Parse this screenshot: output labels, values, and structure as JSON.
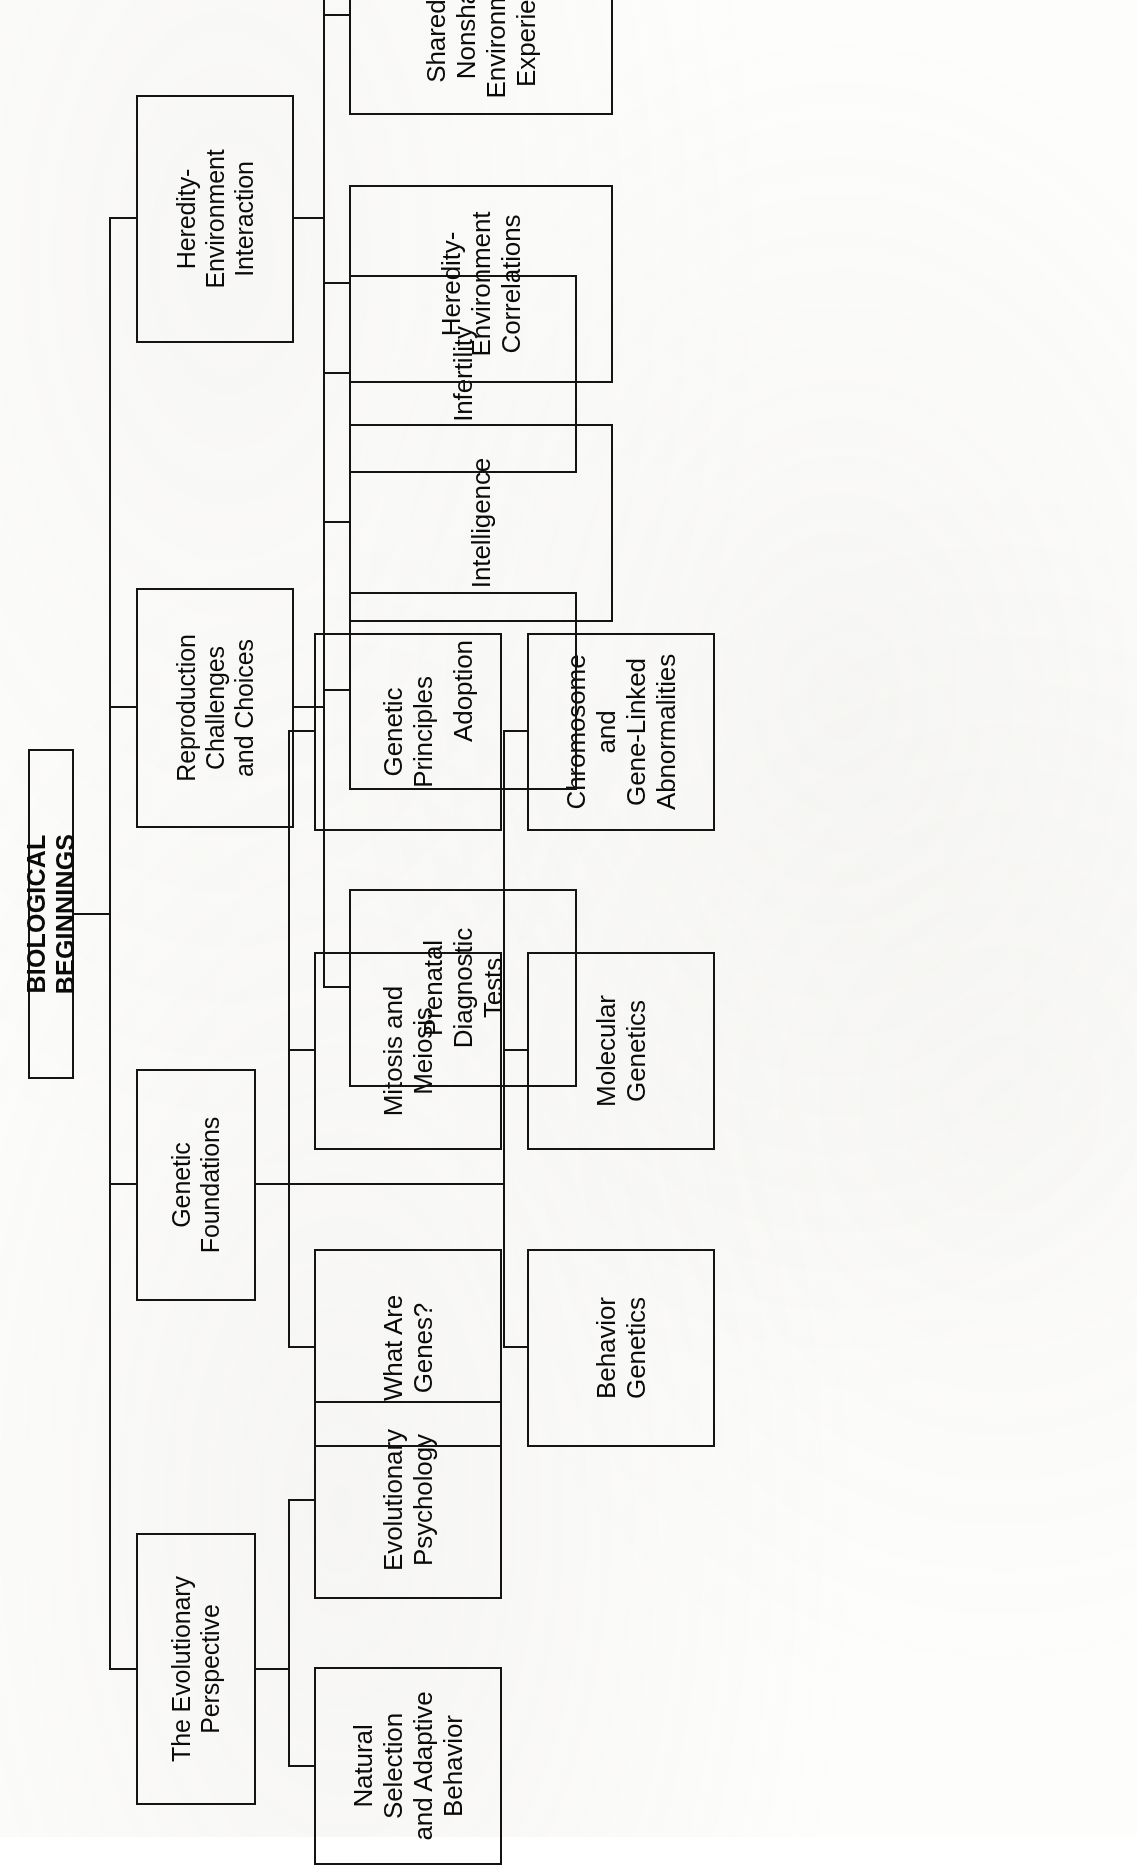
{
  "diagram": {
    "type": "hierarchy-chart",
    "title": "BIOLOGICAL BEGINNINGS",
    "orientation": "page-rotated-90-ccw",
    "branches": [
      {
        "label": "The Evolutionary\nPerspective",
        "children": [
          {
            "label": "Natural Selection\nand Adaptive\nBehavior"
          },
          {
            "label": "Evolutionary\nPsychology"
          }
        ]
      },
      {
        "label": "Genetic\nFoundations",
        "children": [
          {
            "label": "What Are\nGenes?"
          },
          {
            "label": "Mitosis and\nMeiosis"
          },
          {
            "label": "Genetic\nPrinciples"
          },
          {
            "label": "Behavior\nGenetics"
          },
          {
            "label": "Molecular\nGenetics"
          },
          {
            "label": "Chromosome and\nGene-Linked\nAbnormalities"
          }
        ]
      },
      {
        "label": "Reproduction\nChallenges\nand Choices",
        "children": [
          {
            "label": "Prenatal\nDiagnostic\nTests"
          },
          {
            "label": "Adoption"
          },
          {
            "label": "Infertility"
          }
        ]
      },
      {
        "label": "Heredity-\nEnvironment\nInteraction",
        "children": [
          {
            "label": "Intelligence"
          },
          {
            "label": "Heredity-\nEnvironment\nCorrelations"
          },
          {
            "label": "Shared and\nNonshared\nEnvironmental\nExperiences"
          },
          {
            "label": "Conclusions"
          }
        ]
      }
    ]
  },
  "colors": {
    "ink": "#141414",
    "paper": "#fdfdfc"
  }
}
